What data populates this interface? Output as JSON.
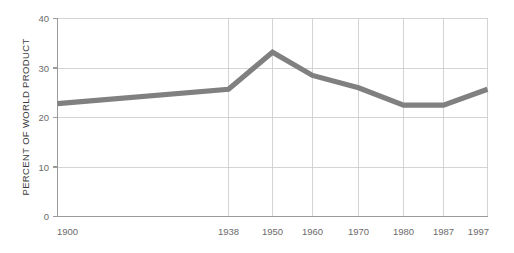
{
  "chart_data": {
    "type": "line",
    "title": "",
    "subtitle": "",
    "xlabel": "",
    "ylabel": "PERCENT OF WORLD PRODUCT",
    "x_tick_labels": [
      "1900",
      "1938",
      "1950",
      "1960",
      "1970",
      "1980",
      "1987",
      "1997"
    ],
    "x": [
      1900,
      1938,
      1950,
      1960,
      1970,
      1980,
      1987,
      1997
    ],
    "y_tick_labels": [
      "0",
      "10",
      "20",
      "30",
      "40"
    ],
    "y_ticks": [
      0,
      10,
      20,
      30,
      40
    ],
    "ylim": [
      0,
      40
    ],
    "xlim": [
      1900,
      1997
    ],
    "values": [
      22.8,
      25.7,
      33.2,
      28.5,
      26.0,
      22.5,
      22.5,
      25.7
    ],
    "series": [
      {
        "name": "Percent of world product",
        "color": "#808080",
        "values": [
          22.8,
          25.7,
          33.2,
          28.5,
          26.0,
          22.5,
          22.5,
          25.7
        ]
      }
    ],
    "grid": "both",
    "legend": "none",
    "annotations": []
  },
  "axis": {
    "y_title": "PERCENT OF WORLD PRODUCT",
    "y_labels": [
      "40",
      "30",
      "20",
      "10",
      "0"
    ],
    "x_labels": [
      "1900",
      "1938",
      "1950",
      "1960",
      "1970",
      "1980",
      "1987",
      "1997"
    ]
  },
  "colors": {
    "line": "#808080",
    "grid": "#c9c9c9",
    "axis": "#9a9a9a",
    "tick_text": "#6b6b6b",
    "title_text": "#3d3d3d",
    "background": "#ffffff"
  }
}
